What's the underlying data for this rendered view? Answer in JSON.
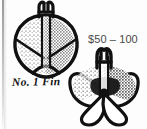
{
  "page": {
    "kind": "scanned-catalog-clipping",
    "background_color": "#fdfdfd",
    "ink_color": "#111111",
    "width": 147,
    "height": 129
  },
  "price": {
    "label": "$50 – 100",
    "color": "#4a4a4a"
  },
  "figures": [
    {
      "id": "fin-top",
      "name": "no-1-fin-front-view",
      "caption": "No. 1 Fin",
      "description": "black ink line drawing of a stippled heart-shaped propeller fin with forked stem"
    },
    {
      "id": "fin-bottom",
      "name": "no-1-fin-angled-view",
      "caption": "",
      "description": "black ink line drawing of the same fin seen from an angle, butterfly shaped blades"
    }
  ],
  "artifacts": {
    "scan_edge_label": "scanner edge shadow"
  }
}
